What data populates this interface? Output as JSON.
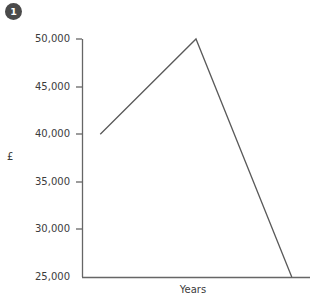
{
  "badge": {
    "label": "1",
    "color": "#4a4a4a",
    "text_color": "#ffffff"
  },
  "chart_data": {
    "type": "line",
    "title": "",
    "subtitle": "",
    "xlabel": "Years",
    "ylabel": "£",
    "ylim": [
      25000,
      50000
    ],
    "yticks": [
      50000,
      45000,
      40000,
      35000,
      30000,
      25000
    ],
    "ytick_labels": [
      "50,000",
      "45,000",
      "40,000",
      "35,000",
      "30,000",
      "25,000"
    ],
    "xticks": [],
    "xtick_labels": [],
    "grid": false,
    "legend": null,
    "annotations": [],
    "series": [
      {
        "name": "value",
        "color": "#5a5a5a",
        "points": [
          {
            "x": 0.08,
            "y": 40000
          },
          {
            "x": 0.5,
            "y": 50000
          },
          {
            "x": 0.92,
            "y": 25000
          }
        ]
      }
    ]
  },
  "axes": {
    "axis_color": "#666666",
    "tick_color": "#666666",
    "label_color": "#3c3c3c"
  }
}
